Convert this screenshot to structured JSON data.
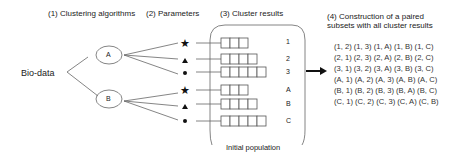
{
  "headers": {
    "step1": "(1) Clustering algorithms",
    "step2": "(2) Parameters",
    "step3": "(3) Cluster results",
    "step4_line1": "(4) Construction of a paired",
    "step4_line2": "subsets with all cluster results"
  },
  "input_label": "Bio-data",
  "algorithms": [
    "A",
    "B"
  ],
  "parameter_symbols": [
    "star",
    "triangle",
    "dot"
  ],
  "cluster_results": [
    {
      "label": "1",
      "boxes": 3
    },
    {
      "label": "2",
      "boxes": 4
    },
    {
      "label": "3",
      "boxes": 5
    },
    {
      "label": "A",
      "boxes": 3
    },
    {
      "label": "B",
      "boxes": 4
    },
    {
      "label": "C",
      "boxes": 5
    }
  ],
  "population_label": "Initial population",
  "pairs": [
    "(1, 2) (1, 3) (1, A) (1, B) (1, C)",
    "(2, 1) (2, 3) (2, A) (2, B) (2, C)",
    "(3, 1) (3, 2) (3, A) (3, B) (3, C)",
    "(A, 1) (A, 2) (A, 3) (A, B) (A, C)",
    "(B, 1) (B, 2) (B, 3) (B, A) (B, C)",
    "(C, 1) (C, 2) (C, 3) (C, A) (C, B)"
  ]
}
